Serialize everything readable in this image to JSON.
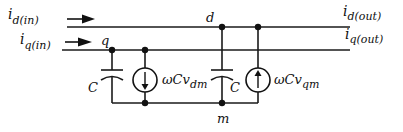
{
  "diagram": {
    "type": "circuit-schematic",
    "inputs": {
      "d_in": {
        "main": "i",
        "sub": "d(in)"
      },
      "q_in": {
        "main": "i",
        "sub": "q(in)"
      }
    },
    "outputs": {
      "d_out": {
        "main": "i",
        "sub": "d(out)"
      },
      "q_out": {
        "main": "i",
        "sub": "q(out)"
      }
    },
    "nodes": {
      "q": "q",
      "d": "d",
      "m": "m"
    },
    "capacitors": {
      "c1": "C",
      "c2": "C"
    },
    "sources": {
      "s1": {
        "main": "ωCv",
        "sub": "dm",
        "direction": "down"
      },
      "s2": {
        "main": "ωCv",
        "sub": "qm",
        "direction": "up"
      }
    },
    "colors": {
      "ink": "#111111",
      "background": "#ffffff"
    }
  }
}
